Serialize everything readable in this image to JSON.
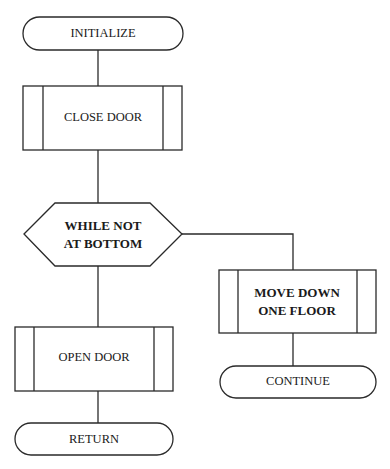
{
  "diagram": {
    "type": "flowchart",
    "nodes": [
      {
        "id": "initialize",
        "shape": "terminator",
        "label": "INITIALIZE"
      },
      {
        "id": "close_door",
        "shape": "predefined-process",
        "label": "CLOSE DOOR"
      },
      {
        "id": "while_not_at_bottom",
        "shape": "loop-hexagon",
        "lines": [
          "WHILE NOT",
          "AT BOTTOM"
        ]
      },
      {
        "id": "move_down",
        "shape": "predefined-process",
        "lines": [
          "MOVE DOWN",
          "ONE FLOOR"
        ]
      },
      {
        "id": "continue",
        "shape": "terminator",
        "label": "CONTINUE"
      },
      {
        "id": "open_door",
        "shape": "predefined-process",
        "label": "OPEN DOOR"
      },
      {
        "id": "return",
        "shape": "terminator",
        "label": "RETURN"
      }
    ],
    "edges": [
      {
        "from": "initialize",
        "to": "close_door"
      },
      {
        "from": "close_door",
        "to": "while_not_at_bottom"
      },
      {
        "from": "while_not_at_bottom",
        "to": "move_down",
        "branch": "loop-body"
      },
      {
        "from": "move_down",
        "to": "continue"
      },
      {
        "from": "while_not_at_bottom",
        "to": "open_door",
        "branch": "exit"
      },
      {
        "from": "open_door",
        "to": "return"
      }
    ]
  }
}
